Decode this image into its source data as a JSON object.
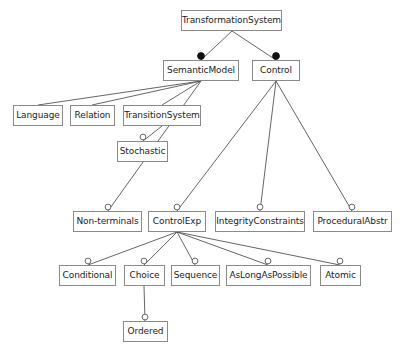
{
  "diagram": {
    "title": "TransformationSystem",
    "type": "uml-class-hierarchy",
    "canvas": {
      "width": 400,
      "height": 353
    },
    "style": {
      "background": "#ffffff",
      "box_border": "#8a8a8a",
      "box_fill": "#ffffff",
      "text_color": "#1c1c1c",
      "edge_color": "#555555",
      "filled_marker_fill": "#111111",
      "hollow_marker_fill": "#ffffff"
    },
    "nodes": [
      {
        "id": "transformationsystem",
        "label": "TransformationSystem",
        "x": 181,
        "y": 10,
        "w": 101,
        "h": 21
      },
      {
        "id": "semanticmodel",
        "label": "SemanticModel",
        "x": 163,
        "y": 60,
        "w": 76,
        "h": 21
      },
      {
        "id": "control",
        "label": "Control",
        "x": 252,
        "y": 60,
        "w": 48,
        "h": 21
      },
      {
        "id": "language",
        "label": "Language",
        "x": 13,
        "y": 105,
        "w": 50,
        "h": 21
      },
      {
        "id": "relation",
        "label": "Relation",
        "x": 70,
        "y": 105,
        "w": 45,
        "h": 21
      },
      {
        "id": "transitionsystem",
        "label": "TransitionSystem",
        "x": 123,
        "y": 105,
        "w": 78,
        "h": 21
      },
      {
        "id": "stochastic",
        "label": "Stochastic",
        "x": 117,
        "y": 141,
        "w": 51,
        "h": 21
      },
      {
        "id": "non-terminals",
        "label": "Non-terminals",
        "x": 73,
        "y": 211,
        "w": 69,
        "h": 21
      },
      {
        "id": "controlexp",
        "label": "ControlExp",
        "x": 148,
        "y": 211,
        "w": 58,
        "h": 21
      },
      {
        "id": "integrityconstraints",
        "label": "IntegrityConstraints",
        "x": 215,
        "y": 211,
        "w": 90,
        "h": 21
      },
      {
        "id": "proceduralabstr",
        "label": "ProceduralAbstr",
        "x": 313,
        "y": 211,
        "w": 79,
        "h": 21
      },
      {
        "id": "conditional",
        "label": "Conditional",
        "x": 59,
        "y": 265,
        "w": 57,
        "h": 21
      },
      {
        "id": "choice",
        "label": "Choice",
        "x": 124,
        "y": 265,
        "w": 41,
        "h": 21
      },
      {
        "id": "sequence",
        "label": "Sequence",
        "x": 171,
        "y": 265,
        "w": 49,
        "h": 21
      },
      {
        "id": "aslongaspossible",
        "label": "AsLongAsPossible",
        "x": 226,
        "y": 265,
        "w": 85,
        "h": 21
      },
      {
        "id": "atomic",
        "label": "Atomic",
        "x": 320,
        "y": 265,
        "w": 41,
        "h": 21
      },
      {
        "id": "ordered",
        "label": "Ordered",
        "x": 123,
        "y": 321,
        "w": 45,
        "h": 21
      }
    ],
    "edges": [
      {
        "from": "transformationsystem",
        "to": "semanticmodel",
        "x1": 232,
        "y1": 31,
        "x2": 201,
        "y2": 60,
        "marker": "filled-circle",
        "marker_x": 201,
        "marker_y": 56
      },
      {
        "from": "transformationsystem",
        "to": "control",
        "x1": 232,
        "y1": 31,
        "x2": 276,
        "y2": 60,
        "marker": "filled-circle",
        "marker_x": 276,
        "marker_y": 56
      },
      {
        "from": "semanticmodel",
        "to": "language",
        "x1": 201,
        "y1": 81,
        "x2": 38,
        "y2": 105,
        "marker": "none",
        "marker_x": 0,
        "marker_y": 0
      },
      {
        "from": "semanticmodel",
        "to": "relation",
        "x1": 201,
        "y1": 81,
        "x2": 92,
        "y2": 105,
        "marker": "none",
        "marker_x": 0,
        "marker_y": 0
      },
      {
        "from": "semanticmodel",
        "to": "transitionsystem",
        "x1": 201,
        "y1": 81,
        "x2": 162,
        "y2": 105,
        "marker": "none",
        "marker_x": 0,
        "marker_y": 0
      },
      {
        "from": "semanticmodel",
        "to": "non-terminals",
        "x1": 201,
        "y1": 81,
        "x2": 108,
        "y2": 211,
        "marker": "hollow-circle",
        "marker_x": 108,
        "marker_y": 207
      },
      {
        "from": "transitionsystem",
        "to": "stochastic",
        "x1": 162,
        "y1": 126,
        "x2": 143,
        "y2": 141,
        "marker": "hollow-circle",
        "marker_x": 143,
        "marker_y": 137
      },
      {
        "from": "control",
        "to": "controlexp",
        "x1": 276,
        "y1": 81,
        "x2": 177,
        "y2": 211,
        "marker": "hollow-circle",
        "marker_x": 177,
        "marker_y": 207
      },
      {
        "from": "control",
        "to": "integrityconstraints",
        "x1": 276,
        "y1": 81,
        "x2": 260,
        "y2": 211,
        "marker": "hollow-circle",
        "marker_x": 260,
        "marker_y": 207
      },
      {
        "from": "control",
        "to": "proceduralabstr",
        "x1": 276,
        "y1": 81,
        "x2": 352,
        "y2": 211,
        "marker": "hollow-circle",
        "marker_x": 352,
        "marker_y": 207
      },
      {
        "from": "controlexp",
        "to": "conditional",
        "x1": 177,
        "y1": 232,
        "x2": 88,
        "y2": 265,
        "marker": "hollow-circle",
        "marker_x": 88,
        "marker_y": 261
      },
      {
        "from": "controlexp",
        "to": "choice",
        "x1": 177,
        "y1": 232,
        "x2": 144,
        "y2": 265,
        "marker": "hollow-circle",
        "marker_x": 144,
        "marker_y": 261
      },
      {
        "from": "controlexp",
        "to": "sequence",
        "x1": 177,
        "y1": 232,
        "x2": 195,
        "y2": 265,
        "marker": "hollow-circle",
        "marker_x": 195,
        "marker_y": 261
      },
      {
        "from": "controlexp",
        "to": "aslongaspossible",
        "x1": 177,
        "y1": 232,
        "x2": 268,
        "y2": 265,
        "marker": "hollow-circle",
        "marker_x": 268,
        "marker_y": 261
      },
      {
        "from": "controlexp",
        "to": "atomic",
        "x1": 177,
        "y1": 232,
        "x2": 340,
        "y2": 265,
        "marker": "hollow-circle",
        "marker_x": 340,
        "marker_y": 261
      },
      {
        "from": "choice",
        "to": "ordered",
        "x1": 144,
        "y1": 286,
        "x2": 145,
        "y2": 321,
        "marker": "hollow-circle",
        "marker_x": 145,
        "marker_y": 317
      }
    ]
  }
}
